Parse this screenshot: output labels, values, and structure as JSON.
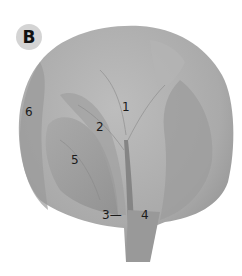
{
  "panel": {
    "badge_letter": "B"
  },
  "labels": [
    {
      "id": "1",
      "text": "1"
    },
    {
      "id": "2",
      "text": "2"
    },
    {
      "id": "3",
      "text": "3—"
    },
    {
      "id": "4",
      "text": "4"
    },
    {
      "id": "5",
      "text": "5"
    },
    {
      "id": "6",
      "text": "6"
    }
  ],
  "colors": {
    "background": "#ffffff",
    "badge": "#d4d4d4",
    "cabbage_light": "#b9b9b9",
    "cabbage_mid": "#a4a4a4",
    "cabbage_dark": "#8a8a8a"
  }
}
